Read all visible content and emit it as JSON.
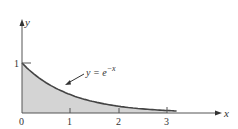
{
  "chart_data": {
    "type": "area",
    "title": "",
    "xlabel": "x",
    "ylabel": "y",
    "function": "y = e^{-x}",
    "annotation": {
      "text_base": "y = e",
      "text_exp": "−x"
    },
    "x_ticks": [
      "0",
      "1",
      "2",
      "3"
    ],
    "y_ticks": [
      "1"
    ],
    "xlim": [
      0,
      3
    ],
    "ylim": [
      0,
      1
    ],
    "shaded_region": {
      "from": 0,
      "to": 3
    },
    "x": [
      0,
      0.5,
      1,
      1.5,
      2,
      2.5,
      3
    ],
    "values": [
      1,
      0.607,
      0.368,
      0.223,
      0.135,
      0.082,
      0.05
    ],
    "colors": {
      "fill": "#d4d4d4",
      "curve": "#444444",
      "axes": "#555555"
    }
  }
}
